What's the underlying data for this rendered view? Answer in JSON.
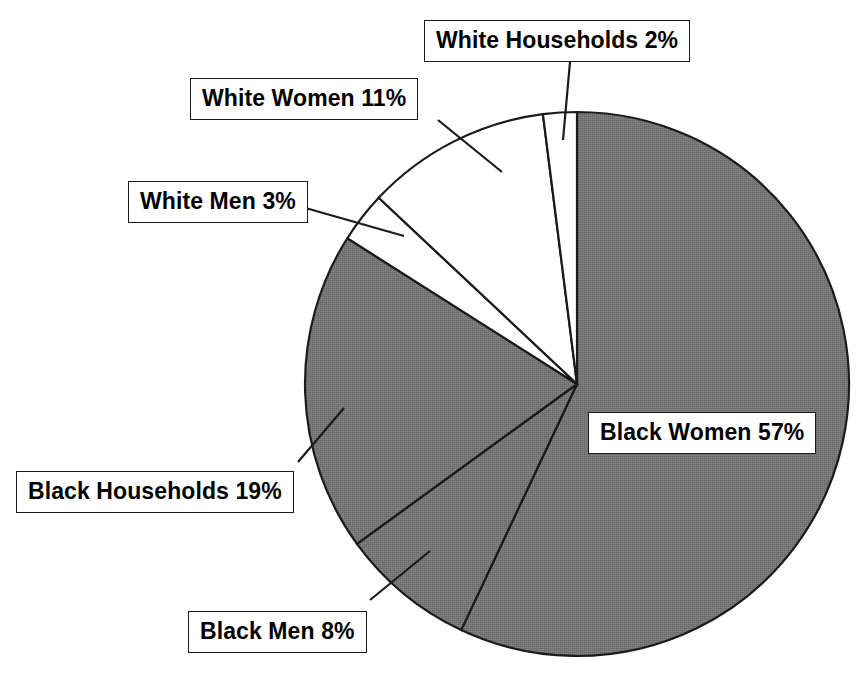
{
  "chart_data": {
    "type": "pie",
    "title": "",
    "subtitle": "",
    "xlabel": "",
    "ylabel": "",
    "legend_position": "none",
    "grid": false,
    "start_angle_deg": 0,
    "direction": "clockwise",
    "units": "percent",
    "categories": [
      "Black Women",
      "Black Men",
      "Black Households",
      "White Men",
      "White Women",
      "White Households"
    ],
    "values": [
      57,
      8,
      19,
      3,
      11,
      2
    ],
    "labels": [
      "Black Women 57%",
      "Black Men 8%",
      "Black Households 19%",
      "White Men 3%",
      "White Women 11%",
      "White Households 2%"
    ],
    "slice_colors": [
      "#787878",
      "#787878",
      "#787878",
      "#ffffff",
      "#ffffff",
      "#ffffff"
    ],
    "slices": [
      {
        "name": "Black Women",
        "value": 57,
        "label": "Black Women 57%",
        "color": "#787878",
        "start_deg": 0.0,
        "end_deg": 205.2
      },
      {
        "name": "Black Men",
        "value": 8,
        "label": "Black Men 8%",
        "color": "#787878",
        "start_deg": 205.2,
        "end_deg": 234.0
      },
      {
        "name": "Black Households",
        "value": 19,
        "label": "Black Households 19%",
        "color": "#787878",
        "start_deg": 234.0,
        "end_deg": 302.4
      },
      {
        "name": "White Men",
        "value": 3,
        "label": "White Men 3%",
        "color": "#ffffff",
        "start_deg": 302.4,
        "end_deg": 313.2
      },
      {
        "name": "White Women",
        "value": 11,
        "label": "White Women 11%",
        "color": "#ffffff",
        "start_deg": 313.2,
        "end_deg": 352.8
      },
      {
        "name": "White Households",
        "value": 2,
        "label": "White Households 2%",
        "color": "#ffffff",
        "start_deg": 352.8,
        "end_deg": 360.0
      }
    ],
    "outline_color": "#1a1a1a",
    "background_color": "#ffffff"
  },
  "callouts": {
    "white_households": "White Households 2%",
    "white_women": "White Women 11%",
    "white_men": "White Men 3%",
    "black_women": "Black Women 57%",
    "black_households": "Black Households 19%",
    "black_men": "Black Men 8%"
  }
}
